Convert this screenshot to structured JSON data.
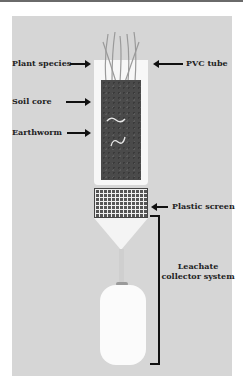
{
  "figure": {
    "labels": {
      "plant_species": "Plant species",
      "pvc_tube": "PVC tube",
      "soil_core": "Soil core",
      "earthworm": "Earthworm",
      "plastic_screen": "Plastic screen",
      "leachate_line1": "Leachate",
      "leachate_line2": "collector system"
    },
    "colors": {
      "panel": "#d6d6d6",
      "soil": "#4a4a4a",
      "tube": "#f7f7f7",
      "arrow": "#111111"
    }
  }
}
